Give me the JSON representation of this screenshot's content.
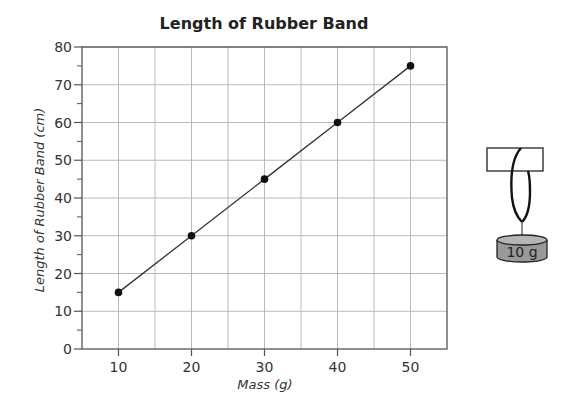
{
  "chart_data": {
    "type": "line",
    "title": "Length of Rubber Band",
    "xlabel": "Mass (g)",
    "ylabel": "Length of Rubber Band (cm)",
    "x": [
      10,
      20,
      30,
      40,
      50
    ],
    "series": [
      {
        "name": "Length of Rubber Band",
        "values": [
          15,
          30,
          45,
          60,
          75
        ]
      }
    ],
    "xlim": [
      5,
      55
    ],
    "ylim": [
      0,
      80
    ],
    "x_ticks": [
      10,
      20,
      30,
      40,
      50
    ],
    "y_ticks": [
      0,
      10,
      20,
      30,
      40,
      50,
      60,
      70,
      80
    ],
    "x_gridlines": [
      10,
      15,
      20,
      25,
      30,
      35,
      40,
      45,
      50
    ],
    "y_gridlines": [
      10,
      20,
      30,
      40,
      50,
      60,
      70,
      80
    ],
    "y_minor_ticks": [
      5,
      15,
      25,
      35,
      45,
      55,
      65,
      75
    ],
    "grid": true,
    "markers": true,
    "legend": null
  },
  "illustration": {
    "weight_label": "10 g"
  },
  "colors": {
    "axis": "#555555",
    "grid": "#bbbbbb",
    "line": "#333333",
    "marker": "#111111",
    "weight_fill": "#999999",
    "weight_top": "#b5b5b5"
  }
}
